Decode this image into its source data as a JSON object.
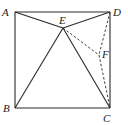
{
  "diagram": {
    "type": "geometry",
    "points": [
      {
        "id": "A",
        "label": "A",
        "x": 15,
        "y": 12,
        "lx": 2,
        "ly": 16
      },
      {
        "id": "D",
        "label": "D",
        "x": 110,
        "y": 12,
        "lx": 113,
        "ly": 16
      },
      {
        "id": "B",
        "label": "B",
        "x": 15,
        "y": 108,
        "lx": 3,
        "ly": 112
      },
      {
        "id": "C",
        "label": "C",
        "x": 110,
        "y": 108,
        "lx": 103,
        "ly": 122
      },
      {
        "id": "E",
        "label": "E",
        "x": 63,
        "y": 28,
        "lx": 59,
        "ly": 24
      },
      {
        "id": "F",
        "label": "F",
        "x": 99,
        "y": 55,
        "lx": 102,
        "ly": 58
      }
    ],
    "solid_segments": [
      [
        "A",
        "D"
      ],
      [
        "D",
        "C"
      ],
      [
        "C",
        "B"
      ],
      [
        "B",
        "A"
      ],
      [
        "A",
        "E"
      ],
      [
        "D",
        "E"
      ],
      [
        "B",
        "E"
      ],
      [
        "C",
        "E"
      ]
    ],
    "dashed_segments": [
      [
        "E",
        "F"
      ],
      [
        "D",
        "F"
      ],
      [
        "F",
        "C"
      ]
    ],
    "colors": {
      "stroke": "#2a2a2a",
      "background": "#ffffff"
    }
  }
}
